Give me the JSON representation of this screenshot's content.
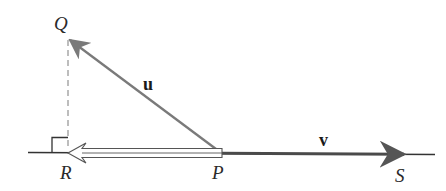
{
  "diagram": {
    "type": "vector-projection",
    "points": {
      "Q": {
        "label": "Q"
      },
      "R": {
        "label": "R"
      },
      "P": {
        "label": "P"
      },
      "S": {
        "label": "S"
      }
    },
    "vectors": {
      "u": {
        "label": "u",
        "from": "P",
        "to": "Q"
      },
      "v": {
        "label": "v",
        "from": "P",
        "to": "S"
      }
    },
    "projection": {
      "from": "P",
      "to": "R",
      "style": "hollow-arrow"
    },
    "perpendicular": {
      "from": "Q",
      "to": "R",
      "style": "dashed",
      "right_angle_at": "R"
    },
    "colors": {
      "vector_u": "#7a7a7a",
      "vector_v": "#4a4a4a",
      "baseline": "#333333",
      "dashed": "#9a9a9a",
      "projection_outline": "#555555"
    }
  }
}
